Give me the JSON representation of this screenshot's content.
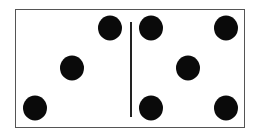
{
  "domino": {
    "left_half": {
      "value": 3,
      "pips": [
        [
          110,
          28
        ],
        [
          72,
          68
        ],
        [
          35,
          108
        ]
      ]
    },
    "right_half": {
      "value": 5,
      "pips": [
        [
          151,
          28
        ],
        [
          226,
          28
        ],
        [
          188,
          68
        ],
        [
          151,
          108
        ],
        [
          226,
          108
        ]
      ]
    },
    "pip_color": "#0a0a0a",
    "border_color": "#555555"
  }
}
